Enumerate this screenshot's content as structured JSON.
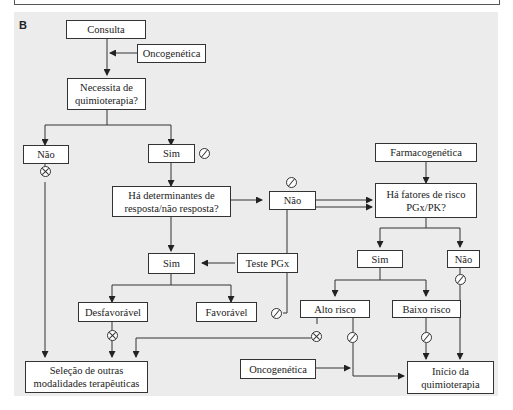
{
  "panel": {
    "label": "B"
  },
  "nodes": {
    "consulta": "Consulta",
    "oncogenetica_top": "Oncogenética",
    "necessita": "Necessita de\nquimioterapia?",
    "nao_left": "Não",
    "sim_top": "Sim",
    "determinantes": "Há determinantes de\nresposta/não resposta?",
    "nao_mid": "Não",
    "farmacogenetica": "Farmacogenética",
    "fatores": "Há fatores de risco\nPGx/PK?",
    "sim_mid": "Sim",
    "teste_pgx": "Teste PGx",
    "sim_right": "Sim",
    "nao_right": "Não",
    "desfavoravel": "Desfavorável",
    "favoravel": "Favorável",
    "alto_risco": "Alto risco",
    "baixo_risco": "Baixo risco",
    "selecao": "Seleção de outras\nmodalidades terapêuticas",
    "oncogenetica_bottom": "Oncogenética",
    "inicio": "Início da\nquimioterapia"
  },
  "symbols": {
    "yes": "check-circle (slashed circle = go/positive)",
    "no": "cross-circle (x in circle = stop/negative)"
  },
  "colors": {
    "background": "#ececec",
    "box_fill": "#ffffff",
    "stroke": "#333333"
  }
}
